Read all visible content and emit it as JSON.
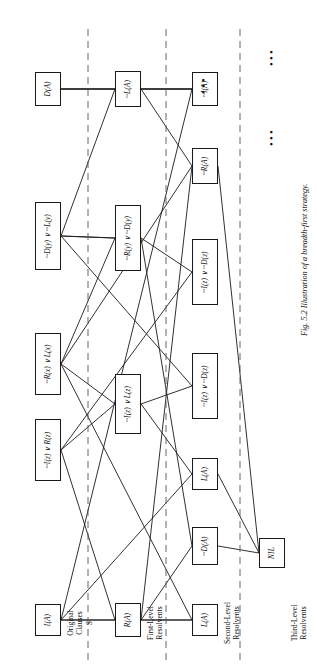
{
  "figure": {
    "caption": "Fig. 5.2 Illustration of a breadth-first strategy.",
    "line_color": "#1a1a1a",
    "box_border_color": "#1a1a1a",
    "divider_color": "#555555",
    "background": "#ffffff"
  },
  "bands": [
    {
      "label": "Original\nClauses\nS",
      "name": "original-clauses"
    },
    {
      "label": "First-Level\nResolvents",
      "name": "first-level-resolvents"
    },
    {
      "label": "Second-Level\nResolvents",
      "name": "second-level-resolvents"
    },
    {
      "label": "Third-Level\nResolvents",
      "name": "third-level-resolvents"
    }
  ],
  "nodes": [
    {
      "id": "n0",
      "label": "I(A)",
      "band": 0
    },
    {
      "id": "n1",
      "label": "~I(z) ∨ R(z)",
      "band": 0
    },
    {
      "id": "n2",
      "label": "~R(x) ∨ L(x)",
      "band": 0
    },
    {
      "id": "n3",
      "label": "~D(y) ∨ ~L(y)",
      "band": 0
    },
    {
      "id": "n4",
      "label": "D(A)",
      "band": 0
    },
    {
      "id": "n5",
      "label": "R(A)",
      "band": 1
    },
    {
      "id": "n6",
      "label": "~I(z) ∨ L(z)",
      "band": 1
    },
    {
      "id": "n7",
      "label": "~R(y) ∨ ~D(y)",
      "band": 1
    },
    {
      "id": "n8",
      "label": "~L(A)",
      "band": 1
    },
    {
      "id": "n9",
      "label": "L(A)",
      "band": 2
    },
    {
      "id": "n10",
      "label": "~D(A)",
      "band": 2
    },
    {
      "id": "n11",
      "label": "L(A)",
      "band": 2
    },
    {
      "id": "n12",
      "label": "~I(z) ∨ ~D(z)",
      "band": 2
    },
    {
      "id": "n13",
      "label": "~I(z) ∨ ~D(z)",
      "band": 2
    },
    {
      "id": "n14",
      "label": "~R(A)",
      "band": 2
    },
    {
      "id": "n15",
      "label": "~I(A)",
      "band": 2
    },
    {
      "id": "n16",
      "label": "NIL",
      "band": 3
    }
  ],
  "ellipses": [
    {
      "name": "ellipsis-second-level"
    },
    {
      "name": "ellipsis-third-level-a"
    },
    {
      "name": "ellipsis-third-level-b"
    }
  ]
}
